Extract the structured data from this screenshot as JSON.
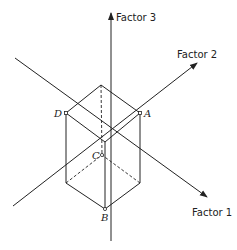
{
  "diagram": {
    "type": "3d-factor-space-box",
    "axes": [
      {
        "id": "factor1",
        "label": "Factor 1",
        "from": [
          15,
          58
        ],
        "to": [
          207,
          197
        ],
        "label_pos": [
          192,
          216
        ]
      },
      {
        "id": "factor2",
        "label": "Factor 2",
        "from": [
          13,
          206
        ],
        "to": [
          197,
          63
        ],
        "label_pos": [
          177,
          58
        ]
      },
      {
        "id": "factor3",
        "label": "Factor 3",
        "from": [
          111,
          241
        ],
        "to": [
          111,
          13
        ],
        "label_pos": [
          116,
          21
        ]
      }
    ],
    "vertices": [
      {
        "id": "A",
        "label": "A",
        "point": [
          140,
          113
        ],
        "label_pos": [
          144,
          117
        ]
      },
      {
        "id": "B",
        "label": "B",
        "point": [
          105,
          209
        ],
        "label_pos": [
          101,
          221
        ]
      },
      {
        "id": "C",
        "label": "C",
        "point": [
          102,
          155
        ],
        "label_pos": [
          92,
          159
        ]
      },
      {
        "id": "D",
        "label": "D",
        "point": [
          66,
          113
        ],
        "label_pos": [
          54,
          117
        ]
      }
    ],
    "colors": {
      "line": "#222222",
      "background": "#ffffff"
    }
  }
}
